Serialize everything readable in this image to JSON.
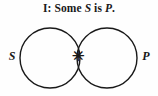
{
  "figure": {
    "type": "venn-diagram",
    "title": {
      "proposition_type": "I",
      "separator": ":",
      "full": "I: Some S is P.",
      "quantifier": "Some",
      "subject_term": "S",
      "copula": "is",
      "predicate_term": "P",
      "terminator": "."
    },
    "background_color": "#fefefe",
    "stroke_color": "#191919",
    "circles": [
      {
        "name": "subject-circle",
        "label": "S",
        "cx": 50,
        "cy": 58,
        "r": 30
      },
      {
        "name": "predicate-circle",
        "label": "P",
        "cx": 107,
        "cy": 58,
        "r": 30
      }
    ],
    "labels": {
      "left": "S",
      "right": "P"
    },
    "marks": [
      {
        "name": "existence-asterisk",
        "glyph": "✳",
        "region": "intersection",
        "x": 78,
        "y": 56,
        "meaning": "at least one S is P"
      }
    ]
  }
}
